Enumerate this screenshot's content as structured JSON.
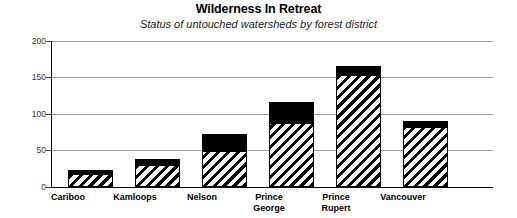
{
  "chart_data": {
    "type": "bar",
    "subtype": "stacked-bar",
    "title": "Wilderness In Retreat",
    "subtitle": "Status of untouched watersheds by forest district",
    "xlabel": "",
    "ylabel": "",
    "ylim": [
      0,
      200
    ],
    "yticks": [
      0,
      50,
      100,
      150,
      200
    ],
    "ytick_labels": [
      "0",
      "50",
      "100",
      "150",
      "200"
    ],
    "grid": true,
    "legend": "none",
    "categories": [
      "Cariboo",
      "Kamloops",
      "Nelson",
      "Prince\nGeorge",
      "Prince\nRupert",
      "Vancouver"
    ],
    "series": [
      {
        "name": "hatched-segment",
        "fill": "diagonal-hatch",
        "values": [
          16,
          29,
          48,
          86,
          152,
          81
        ]
      },
      {
        "name": "solid-segment",
        "fill": "solid-black",
        "values": [
          7,
          9,
          25,
          30,
          14,
          9
        ]
      }
    ],
    "totals": [
      23,
      38,
      73,
      116,
      166,
      90
    ],
    "colors": {
      "solid": "#000000",
      "hatch_stroke": "#000000",
      "hatch_background": "#ffffff",
      "gridline": "#9a9a9a",
      "axis": "#000000",
      "text": "#000000",
      "background": "#ffffff"
    }
  }
}
